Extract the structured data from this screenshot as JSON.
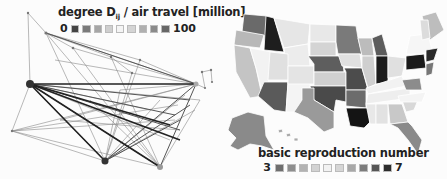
{
  "left_panel": {
    "legend": {
      "title_prefix": "degree D",
      "title_sub": "ij",
      "title_suffix": " / air travel [million]",
      "min_label": "0",
      "max_label": "100",
      "swatches": [
        "#444444",
        "#7a7a7a",
        "#a6a6a6",
        "#cfcfcf",
        "#f4f4f4",
        "#d4d4d4",
        "#b0b0b0",
        "#8a8a8a",
        "#666666"
      ]
    }
  },
  "right_panel": {
    "legend": {
      "title": "basic reproduction number",
      "min_label": "3",
      "max_label": "7",
      "swatches": [
        "#6e6e6e",
        "#8e8e8e",
        "#b2b2b2",
        "#d2d2d2",
        "#f2f2f2",
        "#d6d6d6",
        "#a8a8a8",
        "#7c7c7c",
        "#555555",
        "#2c2c2c"
      ]
    }
  }
}
